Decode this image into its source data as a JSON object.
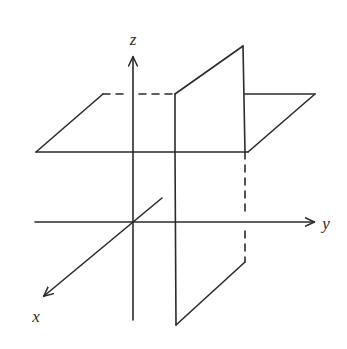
{
  "figure": {
    "name": "three-dimensional-coordinate-system-with-two-planes",
    "width": 347,
    "height": 349,
    "background_color": "#ffffff",
    "line_color": "#2b2b2b",
    "line_width": 1.6,
    "dash_pattern": "7 6"
  },
  "axes": {
    "origin": {
      "x": 133,
      "y": 222
    },
    "items": [
      {
        "id": "z",
        "label": "z",
        "label_x": 133,
        "label_y": 45,
        "direction": "up",
        "arrow": true,
        "start": {
          "x": 133,
          "y": 320
        },
        "end": {
          "x": 133,
          "y": 57
        }
      },
      {
        "id": "y",
        "label": "y",
        "label_x": 326,
        "label_y": 229,
        "direction": "right",
        "arrow": true,
        "start": {
          "x": 35,
          "y": 222
        },
        "end": {
          "x": 314,
          "y": 222
        }
      },
      {
        "id": "x",
        "label": "x",
        "label_x": 36,
        "label_y": 322,
        "direction": "lower-left",
        "arrow": true,
        "start": {
          "x": 162,
          "y": 198
        },
        "end": {
          "x": 44,
          "y": 296
        }
      }
    ]
  },
  "planes": [
    {
      "id": "horizontal-plane",
      "name": "horizontal-plane-xy",
      "orientation": "horizontal",
      "vertices": [
        {
          "x": 36,
          "y": 152
        },
        {
          "x": 103,
          "y": 94
        },
        {
          "x": 315,
          "y": 94
        },
        {
          "x": 248,
          "y": 152
        }
      ]
    },
    {
      "id": "vertical-plane",
      "name": "vertical-plane-yz",
      "orientation": "vertical",
      "vertices": [
        {
          "x": 175,
          "y": 94
        },
        {
          "x": 243,
          "y": 46
        },
        {
          "x": 245,
          "y": 262
        },
        {
          "x": 176,
          "y": 325
        }
      ]
    }
  ],
  "segments": {
    "solid": [
      {
        "name": "horiz-plane-left-edge",
        "x1": 36,
        "y1": 152,
        "x2": 103,
        "y2": 94
      },
      {
        "name": "horiz-plane-front-edge-left",
        "x1": 36,
        "y1": 152,
        "x2": 175,
        "y2": 152
      },
      {
        "name": "horiz-plane-front-edge-right",
        "x1": 175,
        "y1": 152,
        "x2": 248,
        "y2": 152
      },
      {
        "name": "horiz-plane-right-edge",
        "x1": 315,
        "y1": 94,
        "x2": 248,
        "y2": 152
      },
      {
        "name": "horiz-plane-back-edge-right",
        "x1": 245,
        "y1": 94,
        "x2": 315,
        "y2": 94
      },
      {
        "name": "vert-plane-left-edge-upper",
        "x1": 175,
        "y1": 94,
        "x2": 175,
        "y2": 152
      },
      {
        "name": "vert-plane-left-edge-lower",
        "x1": 175,
        "y1": 152,
        "x2": 176,
        "y2": 325
      },
      {
        "name": "vert-plane-top-edge",
        "x1": 175,
        "y1": 94,
        "x2": 243,
        "y2": 46
      },
      {
        "name": "vert-plane-right-edge-upper",
        "x1": 243,
        "y1": 46,
        "x2": 245,
        "y2": 152
      },
      {
        "name": "vert-plane-bottom-edge",
        "x1": 176,
        "y1": 325,
        "x2": 245,
        "y2": 262
      }
    ],
    "dashed": [
      {
        "name": "horiz-plane-back-edge-hidden-a",
        "x1": 103,
        "y1": 94,
        "x2": 128,
        "y2": 94
      },
      {
        "name": "horiz-plane-back-edge-hidden-b",
        "x1": 139,
        "y1": 94,
        "x2": 175,
        "y2": 94
      },
      {
        "name": "vert-plane-right-edge-hidden-a",
        "x1": 245,
        "y1": 152,
        "x2": 245,
        "y2": 214
      },
      {
        "name": "vert-plane-right-edge-hidden-b",
        "x1": 245,
        "y1": 231,
        "x2": 245,
        "y2": 262
      }
    ]
  }
}
